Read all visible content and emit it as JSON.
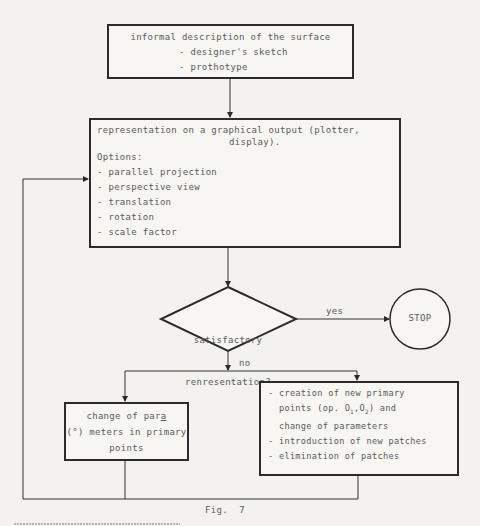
{
  "diagram": {
    "type": "flowchart",
    "caption": "Fig.  7",
    "nodes": {
      "input": {
        "title": "informal description of the surface",
        "items": [
          "- designer's sketch",
          "- prothotype"
        ]
      },
      "representation": {
        "title_line1": "representation on a graphical output (plotter,",
        "title_line2": "display).",
        "options_label": "Options:",
        "options": [
          "- parallel projection",
          "- perspective view",
          "- translation",
          "- rotation",
          "- scale factor"
        ]
      },
      "decision": {
        "line1": "satisfactory",
        "line2": "renresentation?"
      },
      "stop": {
        "label": "STOP"
      },
      "change_params": {
        "line1_pre": "change of par",
        "line1_u": "a",
        "line2": "(°) meters in primary",
        "line3": "points"
      },
      "new_points": {
        "item1_line1": "- creation of new primary",
        "item1_line2_pre": "  points (op. O",
        "item1_line2_sub1": "1",
        "item1_line2_mid": ",O",
        "item1_line2_sub2": "2",
        "item1_line2_post": ") and",
        "item1_line3": "  change of parameters",
        "item2": "- introduction of new patches",
        "item3": "- elimination of patches"
      }
    },
    "edge_labels": {
      "yes": "yes",
      "no": "no"
    }
  }
}
